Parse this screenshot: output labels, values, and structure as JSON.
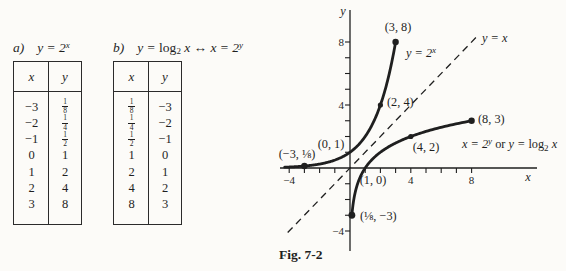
{
  "page_background": "#fcfbf8",
  "ink_color": "#1f1f1f",
  "tables": [
    {
      "label": "a)",
      "equation_parts": [
        [
          "y = 2",
          "i"
        ],
        [
          "x",
          "sup"
        ]
      ],
      "columns": [
        "x",
        "y"
      ],
      "rows": [
        [
          "−3",
          "1/8"
        ],
        [
          "−2",
          "1/4"
        ],
        [
          "−1",
          "1/2"
        ],
        [
          "0",
          "1"
        ],
        [
          "1",
          "2"
        ],
        [
          "2",
          "4"
        ],
        [
          "3",
          "8"
        ]
      ]
    },
    {
      "label": "b)",
      "equation_parts": [
        [
          "y = ",
          "i"
        ],
        [
          "log",
          "rm"
        ],
        [
          "2",
          "sub"
        ],
        [
          " x ↔ x = 2",
          "i"
        ],
        [
          "y",
          "sup"
        ]
      ],
      "columns": [
        "x",
        "y"
      ],
      "rows": [
        [
          "1/8",
          "−3"
        ],
        [
          "1/4",
          "−2"
        ],
        [
          "1/2",
          "−1"
        ],
        [
          "1",
          "0"
        ],
        [
          "2",
          "1"
        ],
        [
          "4",
          "2"
        ],
        [
          "8",
          "3"
        ]
      ]
    }
  ],
  "chart_data": {
    "type": "line",
    "title": "Fig. 7-2",
    "xlabel": "x",
    "ylabel": "y",
    "xlim": [
      -4.7,
      12.2
    ],
    "ylim": [
      -5.3,
      10.3
    ],
    "grid": false,
    "x_ticks": [
      -4,
      -3,
      -2,
      -1,
      1,
      2,
      3,
      4,
      5,
      6,
      7,
      8
    ],
    "y_ticks": [
      -4,
      -3,
      -2,
      -1,
      1,
      2,
      3,
      4,
      5,
      6,
      7,
      8
    ],
    "x_tick_labels": [
      {
        "v": -4,
        "t": "−4"
      },
      {
        "v": 4,
        "t": "4"
      },
      {
        "v": 8,
        "t": "8"
      }
    ],
    "y_tick_labels": [
      {
        "v": -4,
        "t": "−4"
      },
      {
        "v": 4,
        "t": "4"
      },
      {
        "v": 8,
        "t": "8"
      }
    ],
    "series": [
      {
        "name": "y = 2^x",
        "fn": "pow2",
        "style": "solid",
        "domain": [
          -4.3,
          3
        ],
        "points": [
          [
            -3,
            0.125
          ],
          [
            -2,
            0.25
          ],
          [
            -1,
            0.5
          ],
          [
            0,
            1
          ],
          [
            1,
            2
          ],
          [
            2,
            4
          ],
          [
            3,
            8
          ]
        ],
        "markers": [
          {
            "at": [
              -3,
              0.125
            ],
            "r": 3.2
          },
          {
            "at": [
              2,
              4
            ],
            "r": 2.6
          },
          {
            "at": [
              3,
              8
            ],
            "r": 3.2
          }
        ]
      },
      {
        "name": "x = 2^y or y = log2 x",
        "fn": "log2",
        "style": "solid",
        "domain": [
          0.125,
          8
        ],
        "points": [
          [
            0.125,
            -3
          ],
          [
            0.25,
            -2
          ],
          [
            0.5,
            -1
          ],
          [
            1,
            0
          ],
          [
            2,
            1
          ],
          [
            4,
            2
          ],
          [
            8,
            3
          ]
        ],
        "markers": [
          {
            "at": [
              0.125,
              -3
            ],
            "r": 3.4
          },
          {
            "at": [
              4,
              2
            ],
            "r": 2.6
          },
          {
            "at": [
              8,
              3
            ],
            "r": 3.2
          }
        ]
      },
      {
        "name": "y = x",
        "fn": "identity",
        "style": "dashed",
        "domain": [
          -4.1,
          8.35
        ],
        "points": [
          [
            -4,
            -4
          ],
          [
            8,
            8
          ]
        ],
        "markers": []
      }
    ],
    "point_labels": [
      {
        "text": "(3, 8)",
        "px": [
          120,
          31
        ],
        "anchor": "middle"
      },
      {
        "text": "(2, 4)",
        "px": [
          109,
          106
        ],
        "anchor": "start"
      },
      {
        "text": "(0, 1)",
        "px": [
          53,
          148
        ],
        "anchor": "middle"
      },
      {
        "text": "(−3, ⅛)",
        "px": [
          19,
          158
        ],
        "anchor": "middle"
      },
      {
        "text": "(1, 0)",
        "px": [
          95,
          184
        ],
        "anchor": "middle"
      },
      {
        "text": "(4, 2)",
        "px": [
          148,
          151
        ],
        "anchor": "middle"
      },
      {
        "text": "(8, 3)",
        "px": [
          200,
          123
        ],
        "anchor": "start"
      },
      {
        "text": "(⅛, −3)",
        "px": [
          82,
          220
        ],
        "anchor": "start"
      }
    ],
    "curve_labels": [
      {
        "parts": [
          [
            "y = 2",
            "i"
          ],
          [
            "x",
            "sup"
          ]
        ],
        "px": [
          128,
          57
        ],
        "anchor": "start"
      },
      {
        "parts": [
          [
            "y = x",
            "i"
          ]
        ],
        "px": [
          204,
          42
        ],
        "anchor": "start"
      },
      {
        "parts": [
          [
            "x = 2",
            "i"
          ],
          [
            "y",
            "sup"
          ],
          [
            " or ",
            "rm"
          ],
          [
            "y = ",
            "i"
          ],
          [
            "log",
            "rm"
          ],
          [
            "2",
            "sub"
          ],
          [
            " x",
            "i"
          ]
        ],
        "px": [
          184,
          148
        ],
        "anchor": "start"
      }
    ]
  }
}
